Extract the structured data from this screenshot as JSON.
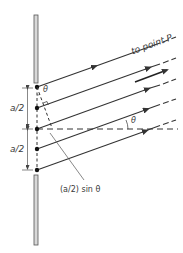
{
  "diagram": {
    "labels": {
      "to_point": "to point P",
      "half_width_top": "a/2",
      "half_width_bottom": "a/2",
      "path_difference": "(a/2) sin θ",
      "theta_near_slit": "θ",
      "theta_at_horizontal": "θ"
    },
    "slit": {
      "sources": 5,
      "wall_color": "#d8d8d8",
      "wall_border": "#555555"
    },
    "rays": {
      "count": 5,
      "angle_label": "θ",
      "color": "#333333"
    },
    "colors": {
      "line": "#333333",
      "text": "#3a3a3a",
      "background": "#ffffff"
    }
  }
}
